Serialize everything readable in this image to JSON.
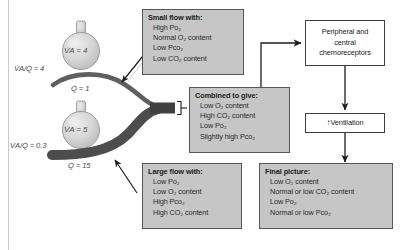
{
  "diagram": {
    "colors": {
      "box_fill": "#c6c6c6",
      "box_border": "#565656",
      "plain_box_fill": "#ffffff",
      "plain_box_border": "#3d3d3d",
      "vessel_light": "#6e6e6e",
      "vessel_dark": "#4a4a4a",
      "alveolus_fill": "#d2d2d2",
      "background": "#ffffff"
    }
  },
  "lung_units": {
    "top": {
      "ratio_label": "V̇A/Q̇ = 4",
      "ratio_value": 4,
      "ventilation_label": "V̇A = 4",
      "ventilation_value": 4,
      "perfusion_label": "Q̇ = 1",
      "perfusion_value": 1
    },
    "bottom": {
      "ratio_label": "V̇A/Q̇ = 0.3",
      "ratio_value": 0.3,
      "ventilation_label": "V̇A = 5",
      "ventilation_value": 5,
      "perfusion_label": "Q̇ = 15",
      "perfusion_value": 15
    }
  },
  "boxes": {
    "small_flow": {
      "title": "Small flow with:",
      "lines": [
        "High Po₂",
        "Normal O₂ content",
        "Low Pco₂",
        "Low CO₂ content"
      ]
    },
    "large_flow": {
      "title": "Large flow with:",
      "lines": [
        "Low Po₂",
        "Low O₂ content",
        "High Pco₂",
        "High CO₂ content"
      ]
    },
    "combined": {
      "title": "Combined to give:",
      "lines": [
        "Low O₂ content",
        "High CO₂ content",
        "Low Po₂",
        "Slightly high Pco₂"
      ]
    },
    "final_picture": {
      "title": "Final picture:",
      "lines": [
        "Low O₂ content",
        "Normal or low CO₂ content",
        "Low Po₂",
        "Normal or low Pco₂"
      ]
    },
    "chemoreceptors": {
      "lines": [
        "Peripheral and",
        "central",
        "chemoreceptors"
      ]
    },
    "ventilation": {
      "arrow": "↑",
      "label": "Ventilation"
    }
  },
  "connectors": [
    {
      "name": "small-flow-to-top-vessel",
      "style": "arrow"
    },
    {
      "name": "large-flow-to-bottom-vessel",
      "style": "arrow"
    },
    {
      "name": "trunk-to-combined-bracket",
      "style": "bracket"
    },
    {
      "name": "combined-to-chemoreceptors",
      "style": "elbow-arrow"
    },
    {
      "name": "chemoreceptors-to-ventilation",
      "style": "arrow"
    },
    {
      "name": "ventilation-to-final-picture",
      "style": "arrow"
    }
  ]
}
